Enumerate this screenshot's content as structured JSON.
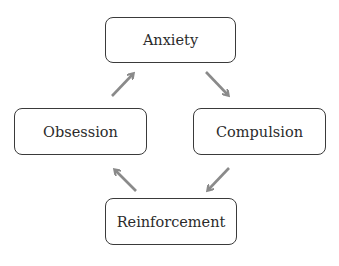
{
  "diagram": {
    "type": "cycle",
    "nodes": [
      {
        "id": "anxiety",
        "label": "Anxiety"
      },
      {
        "id": "compulsion",
        "label": "Compulsion"
      },
      {
        "id": "reinforcement",
        "label": "Reinforcement"
      },
      {
        "id": "obsession",
        "label": "Obsession"
      }
    ],
    "edges": [
      {
        "from": "anxiety",
        "to": "compulsion"
      },
      {
        "from": "compulsion",
        "to": "reinforcement"
      },
      {
        "from": "reinforcement",
        "to": "obsession"
      },
      {
        "from": "obsession",
        "to": "anxiety"
      }
    ],
    "colors": {
      "border": "#3a3a3a",
      "text": "#2b2b2b",
      "arrow": "#8a8a8a",
      "background": "#ffffff"
    }
  }
}
